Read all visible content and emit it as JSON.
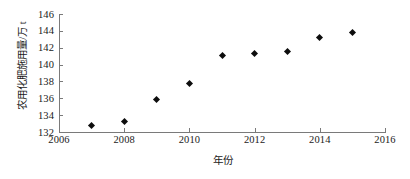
{
  "chart_data": {
    "type": "scatter",
    "title": "",
    "xlabel": "年份",
    "ylabel": "农用化肥施用量/万 t",
    "x": [
      2007,
      2008,
      2009,
      2010,
      2011,
      2012,
      2013,
      2014,
      2015
    ],
    "values": [
      132.8,
      133.2,
      135.9,
      137.7,
      141.1,
      141.3,
      141.5,
      143.2,
      143.8
    ],
    "series": [
      {
        "name": "农用化肥施用量",
        "points": [
          {
            "x": 2007,
            "y": 132.8
          },
          {
            "x": 2008,
            "y": 133.2
          },
          {
            "x": 2009,
            "y": 135.9
          },
          {
            "x": 2010,
            "y": 137.7
          },
          {
            "x": 2011,
            "y": 141.1
          },
          {
            "x": 2012,
            "y": 141.3
          },
          {
            "x": 2013,
            "y": 141.5
          },
          {
            "x": 2014,
            "y": 143.2
          },
          {
            "x": 2015,
            "y": 143.8
          }
        ]
      }
    ],
    "xlim": [
      2006,
      2016
    ],
    "ylim": [
      132,
      146
    ],
    "xticks": [
      "2006",
      "2008",
      "2010",
      "2012",
      "2014",
      "2016"
    ],
    "xtick_values": [
      2006,
      2008,
      2010,
      2012,
      2014,
      2016
    ],
    "yticks": [
      "132",
      "134",
      "136",
      "138",
      "140",
      "142",
      "144",
      "146"
    ],
    "ytick_values": [
      132,
      134,
      136,
      138,
      140,
      142,
      144,
      146
    ],
    "grid": false,
    "legend": null,
    "marker": "diamond",
    "marker_color": "#0d0d0d",
    "axis_color": "#7a7a7a",
    "background": "#ffffff"
  }
}
